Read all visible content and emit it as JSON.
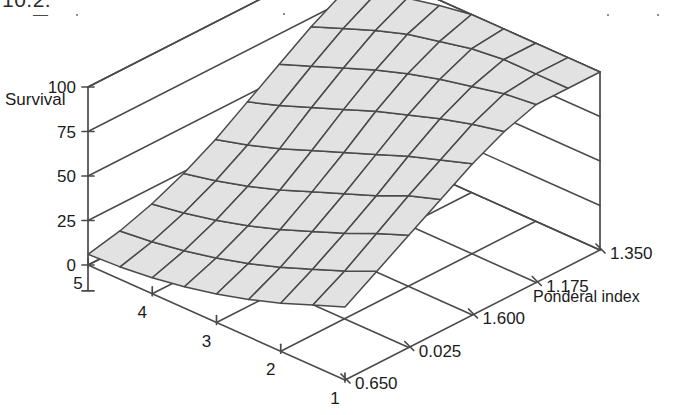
{
  "page": {
    "background": "#ffffff",
    "line_color": "#4a4a4a",
    "surface_fill": "#e2e2e2",
    "text_color": "#1b1b1b",
    "top_fragment": "10.2.",
    "top_dash": "—"
  },
  "chart_data": {
    "type": "surface",
    "title": "",
    "zlabel": "Survival",
    "xlabel": "",
    "ylabel": "Ponderal index",
    "z_ticks": [
      100,
      75,
      50,
      25,
      0
    ],
    "z_tick_labels": [
      "100",
      "75",
      "50",
      "25",
      "0"
    ],
    "zlim": [
      0,
      100
    ],
    "x_ticks": [
      5,
      4,
      3,
      2,
      1
    ],
    "x_tick_labels": [
      "5",
      "4",
      "3",
      "2",
      "1"
    ],
    "y_ticks": [
      0.65,
      0.025,
      1.6,
      1.175,
      1.35
    ],
    "y_tick_labels": [
      "0.650",
      "0.025",
      "1.600",
      "1.175",
      "1.350"
    ],
    "grid": true,
    "legend": "none",
    "nx": 9,
    "ny": 9,
    "surface_z": [
      [
        6,
        10,
        16,
        24,
        34,
        46,
        58,
        70,
        80
      ],
      [
        7,
        12,
        19,
        28,
        39,
        52,
        65,
        77,
        87
      ],
      [
        9,
        15,
        23,
        33,
        45,
        59,
        72,
        84,
        93
      ],
      [
        12,
        19,
        28,
        39,
        52,
        66,
        79,
        90,
        97
      ],
      [
        16,
        24,
        34,
        46,
        59,
        73,
        85,
        94,
        100
      ],
      [
        21,
        30,
        41,
        53,
        66,
        79,
        90,
        98,
        100
      ],
      [
        27,
        37,
        48,
        60,
        73,
        85,
        94,
        100,
        100
      ],
      [
        34,
        44,
        56,
        68,
        79,
        90,
        98,
        100,
        100
      ],
      [
        41,
        52,
        63,
        74,
        85,
        94,
        100,
        100,
        100
      ]
    ]
  }
}
